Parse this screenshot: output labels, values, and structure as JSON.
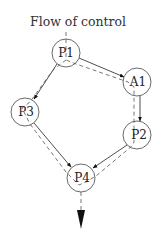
{
  "title": "Flow of control",
  "nodes": [
    {
      "id": "P1",
      "label": "P1",
      "cx": 66,
      "cy": 53
    },
    {
      "id": "A1",
      "label": "A1",
      "cx": 137,
      "cy": 82
    },
    {
      "id": "P3",
      "label": "P3",
      "cx": 25,
      "cy": 112
    },
    {
      "id": "P2",
      "label": "P2",
      "cx": 137,
      "cy": 135
    },
    {
      "id": "P4",
      "label": "P4",
      "cx": 81,
      "cy": 178
    }
  ],
  "edges": [
    {
      "from": "P1",
      "to": "A1"
    },
    {
      "from": "P1",
      "to": "P3"
    },
    {
      "from": "A1",
      "to": "P2"
    },
    {
      "from": "P3",
      "to": "P4"
    },
    {
      "from": "P2",
      "to": "P4"
    }
  ],
  "control_flow_path": [
    "P1",
    "P3",
    "P4",
    "A1",
    "P2",
    "P4"
  ],
  "colors": {
    "stroke": "#333333",
    "background": "#ffffff"
  }
}
